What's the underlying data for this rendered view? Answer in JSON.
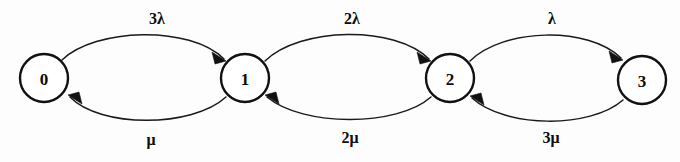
{
  "diagram": {
    "background_color": "#fdfdfd",
    "stroke_color": "#111111",
    "states": [
      {
        "id": "s0",
        "label": "0",
        "cx": 44,
        "cy": 78,
        "r": 24
      },
      {
        "id": "s1",
        "label": "1",
        "cx": 245,
        "cy": 78,
        "r": 24
      },
      {
        "id": "s2",
        "label": "2",
        "cx": 450,
        "cy": 78,
        "r": 24
      },
      {
        "id": "s3",
        "label": "3",
        "cx": 642,
        "cy": 80,
        "r": 24
      }
    ],
    "transitions": [
      {
        "id": "t01",
        "from": "0",
        "to": "1",
        "label": "3λ",
        "direction": "forward",
        "side": "top",
        "label_x": 157,
        "label_y": 24
      },
      {
        "id": "t12",
        "from": "1",
        "to": "2",
        "label": "2λ",
        "direction": "forward",
        "side": "top",
        "label_x": 352,
        "label_y": 24
      },
      {
        "id": "t23",
        "from": "2",
        "to": "3",
        "label": "λ",
        "direction": "forward",
        "side": "top",
        "label_x": 552,
        "label_y": 24
      },
      {
        "id": "t10",
        "from": "1",
        "to": "0",
        "label": "μ",
        "direction": "backward",
        "side": "bottom",
        "label_x": 151,
        "label_y": 145
      },
      {
        "id": "t21",
        "from": "2",
        "to": "1",
        "label": "2μ",
        "direction": "backward",
        "side": "bottom",
        "label_x": 350,
        "label_y": 143
      },
      {
        "id": "t32",
        "from": "3",
        "to": "2",
        "label": "3μ",
        "direction": "backward",
        "side": "bottom",
        "label_x": 551,
        "label_y": 143
      }
    ]
  }
}
